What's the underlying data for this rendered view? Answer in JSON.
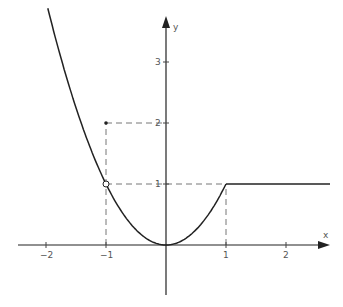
{
  "chart_data": {
    "type": "line",
    "title": "",
    "xlabel": "x",
    "ylabel": "y",
    "x_ticks": [
      -2,
      -1,
      1,
      2
    ],
    "y_ticks": [
      1,
      2,
      3
    ],
    "x_tick_labels": [
      "−2",
      "−1",
      "1",
      "2"
    ],
    "y_tick_labels": [
      "1",
      "2",
      "3"
    ],
    "xlim": [
      -2.4,
      2.7
    ],
    "ylim": [
      -0.8,
      4.0
    ],
    "grid": false,
    "series": [
      {
        "name": "f(x) = x^2 for x < 1, except x = -1",
        "x": [
          -1.97,
          -1.5,
          -1,
          -0.5,
          0,
          0.5,
          1
        ],
        "values": [
          3.88,
          2.25,
          1,
          0.25,
          0,
          0.25,
          1
        ]
      },
      {
        "name": "f(x) = 1 for x >= 1",
        "x": [
          1,
          2.7
        ],
        "values": [
          1,
          1
        ]
      }
    ],
    "points": [
      {
        "x": -1,
        "y": 1,
        "style": "open-circle"
      },
      {
        "x": -1,
        "y": 2,
        "style": "filled-dot"
      }
    ],
    "guides": [
      {
        "from": [
          -1,
          0
        ],
        "to": [
          -1,
          2
        ]
      },
      {
        "from": [
          -1,
          2
        ],
        "to": [
          0,
          2
        ]
      },
      {
        "from": [
          -1,
          1
        ],
        "to": [
          1,
          1
        ]
      },
      {
        "from": [
          1,
          0
        ],
        "to": [
          1,
          1
        ]
      }
    ]
  },
  "labels": {
    "x_axis": "x",
    "y_axis": "y",
    "xt_m2": "−2",
    "xt_m1": "−1",
    "xt_1": "1",
    "xt_2": "2",
    "yt_1": "1",
    "yt_2": "2",
    "yt_3": "3"
  }
}
